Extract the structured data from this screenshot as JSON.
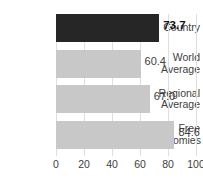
{
  "chart_data": {
    "type": "bar",
    "orientation": "horizontal",
    "title": "",
    "xlabel": "",
    "ylabel": "",
    "xlim": [
      0,
      100
    ],
    "xticks": [
      0,
      20,
      40,
      60,
      80,
      100
    ],
    "grid": true,
    "legend": "none",
    "categories": [
      "Country",
      "World Average",
      "Regional Average",
      "Free Economies"
    ],
    "values": [
      73.7,
      60.4,
      67.0,
      84.6
    ],
    "value_labels": [
      "73.7",
      "60.4",
      "67.0",
      "84.6"
    ],
    "bars": [
      {
        "label_line1": "Country",
        "label_line2": "",
        "value": 73.7,
        "value_label": "73.7",
        "color": "#262626",
        "emphasis": true
      },
      {
        "label_line1": "World",
        "label_line2": "Average",
        "value": 60.4,
        "value_label": "60.4",
        "color": "#c8c8c8",
        "emphasis": false
      },
      {
        "label_line1": "Regional",
        "label_line2": "Average",
        "value": 67.0,
        "value_label": "67.0",
        "color": "#c8c8c8",
        "emphasis": false
      },
      {
        "label_line1": "Free",
        "label_line2": "Economies",
        "value": 84.6,
        "value_label": "84.6",
        "color": "#c8c8c8",
        "emphasis": false
      }
    ],
    "colors": {
      "highlight_bar": "#262626",
      "default_bar": "#c8c8c8",
      "gridline": "#dedede",
      "axis": "#b5b5b5",
      "text": "#3d3d3d",
      "background": "#ffffff"
    }
  }
}
